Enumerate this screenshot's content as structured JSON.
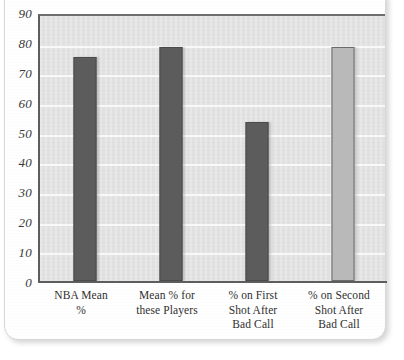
{
  "chart_data": {
    "type": "bar",
    "title": "",
    "subtitle": "",
    "xlabel": "",
    "ylabel": "",
    "ylim": [
      0,
      90
    ],
    "ytick_step": 10,
    "yticks": [
      "90",
      "80",
      "70",
      "60",
      "50",
      "40",
      "30",
      "20",
      "10",
      "0"
    ],
    "grid": true,
    "legend": "none",
    "categories": [
      "NBA Mean\n%",
      "Mean % for\nthese Players",
      "% on First\nShot After\nBad Call",
      "% on Second\nShot After\nBad Call"
    ],
    "category_lines": [
      [
        "NBA Mean",
        "%"
      ],
      [
        "Mean % for",
        "these Players"
      ],
      [
        "% on First",
        "Shot After",
        "Bad Call"
      ],
      [
        "% on Second",
        "Shot After",
        "Bad Call"
      ]
    ],
    "values": [
      76,
      79.5,
      54,
      79.5
    ],
    "bar_styles": [
      "dark",
      "dark",
      "dark",
      "light"
    ],
    "colors": {
      "bar_dark": "#5c5c5c",
      "bar_light": "#b9b9b9",
      "bar_outline": "#4a4a4a",
      "plot_background": "#e4e4e4",
      "gridline": "#fafafa",
      "axis": "#5d5d5d",
      "card_background": "#ffffff",
      "text": "#2f2f2f"
    }
  }
}
